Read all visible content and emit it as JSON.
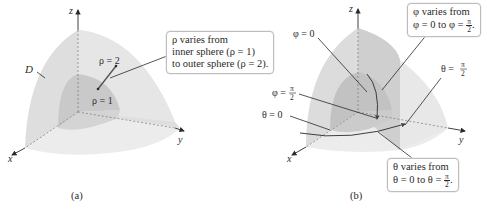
{
  "figure_a": {
    "caption": "(a)",
    "axes": {
      "z": "z",
      "x": "x",
      "y": "y"
    },
    "region_label": "D",
    "labels": {
      "rho_outer": "ρ = 2",
      "rho_inner": "ρ = 1"
    },
    "callout": {
      "line1": "ρ varies from",
      "line2": "inner sphere (ρ = 1)",
      "line3": "to outer sphere (ρ = 2)."
    }
  },
  "figure_b": {
    "caption": "(b)",
    "axes": {
      "z": "z",
      "x": "x",
      "y": "y"
    },
    "labels": {
      "phi_zero": "φ = 0",
      "phi_half_pi_prefix": "φ =",
      "theta_zero": "θ = 0",
      "theta_half_pi_prefix": "θ =",
      "pi": "π",
      "two": "2"
    },
    "callout_phi": {
      "line1": "φ varies from",
      "line2_prefix": "φ = 0 to φ =",
      "frac_num": "π",
      "frac_den": "2",
      "suffix": "."
    },
    "callout_theta": {
      "line1": "θ varies from",
      "line2_prefix": "θ = 0 to θ =",
      "frac_num": "π",
      "frac_den": "2",
      "suffix": "."
    }
  },
  "colors": {
    "outer_shell": "#dcdcdc",
    "inner_shell": "#c8c8c8",
    "floor": "#ebebeb",
    "ink": "#2a2a2a",
    "callout_border": "#bdbdbd"
  }
}
